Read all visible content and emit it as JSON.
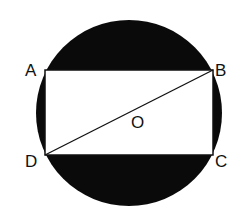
{
  "diagram": {
    "colors": {
      "shade": "#0a0a0a",
      "background": "#ffffff",
      "line": "#111111"
    },
    "circle": {
      "cx": 129,
      "cy": 113,
      "r": 93,
      "center_label": "O"
    },
    "points": {
      "A": {
        "label": "A",
        "x": 45,
        "y": 70
      },
      "B": {
        "label": "B",
        "x": 213,
        "y": 70
      },
      "C": {
        "label": "C",
        "x": 213,
        "y": 155
      },
      "D": {
        "label": "D",
        "x": 45,
        "y": 155
      }
    },
    "segments": [
      "AB",
      "BC",
      "CD",
      "DA",
      "BD"
    ]
  }
}
